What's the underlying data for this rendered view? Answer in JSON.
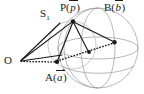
{
  "figure": {
    "type": "geometry-diagram",
    "background_color": "#ffffff",
    "ink_color": "#1a1a1a",
    "sphere_line_color": "#9a9a9a",
    "labels": {
      "s1": {
        "text": "S",
        "subscript": "1",
        "name": "sphere-label"
      },
      "p": {
        "prefix": "P(",
        "vector": "p",
        "suffix": ")",
        "name": "point-p-label"
      },
      "b": {
        "prefix": "B(",
        "vector": "b",
        "suffix": ")",
        "name": "point-b-label"
      },
      "a": {
        "prefix": "A(",
        "vector": "a",
        "suffix": ")",
        "name": "point-a-label"
      },
      "o": {
        "text": "O",
        "name": "origin-label"
      }
    },
    "points": {
      "O": {
        "x": 20,
        "y": 61
      },
      "P": {
        "x": 73,
        "y": 21
      },
      "B": {
        "x": 115,
        "y": 42
      },
      "A": {
        "x": 57,
        "y": 62
      },
      "M": {
        "x": 89,
        "y": 52
      }
    },
    "sphere": {
      "center_x": 98,
      "center_y": 48,
      "radius_x": 40,
      "radius_y": 40
    }
  }
}
